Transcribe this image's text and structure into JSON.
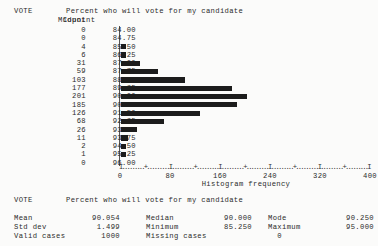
{
  "report": {
    "variable_name": "VOTE",
    "variable_label": "Percent who will vote for my candidate",
    "headers": {
      "count": "Count",
      "midpoint": "Midpoint"
    },
    "axis_title": "Histogram frequency"
  },
  "chart_data": {
    "type": "bar",
    "orientation": "horizontal",
    "title": "Percent who will vote for my candidate",
    "xlabel": "Histogram frequency",
    "ylabel": "Midpoint",
    "xlim": [
      0,
      400
    ],
    "xticks": [
      0,
      80,
      160,
      240,
      320,
      400
    ],
    "minor_tick_step": 40,
    "grid": false,
    "legend": null,
    "bar_color": "#1c1c1c",
    "categories": [
      "84.00",
      "84.75",
      "85.50",
      "86.25",
      "87.00",
      "87.75",
      "88.50",
      "89.25",
      "90.00",
      "90.75",
      "91.50",
      "92.25",
      "93.00",
      "93.75",
      "94.50",
      "95.25",
      "96.00"
    ],
    "values": [
      0,
      0,
      4,
      6,
      31,
      59,
      103,
      177,
      201,
      185,
      126,
      68,
      26,
      11,
      2,
      1,
      0
    ],
    "rows": [
      {
        "count": "0",
        "midpoint": "84.00",
        "value": 0
      },
      {
        "count": "0",
        "midpoint": "84.75",
        "value": 0
      },
      {
        "count": "4",
        "midpoint": "85.50",
        "value": 4
      },
      {
        "count": "6",
        "midpoint": "86.25",
        "value": 6
      },
      {
        "count": "31",
        "midpoint": "87.00",
        "value": 31
      },
      {
        "count": "59",
        "midpoint": "87.75",
        "value": 59
      },
      {
        "count": "103",
        "midpoint": "88.50",
        "value": 103
      },
      {
        "count": "177",
        "midpoint": "89.25",
        "value": 177
      },
      {
        "count": "201",
        "midpoint": "90.00",
        "value": 201
      },
      {
        "count": "185",
        "midpoint": "90.75",
        "value": 185
      },
      {
        "count": "126",
        "midpoint": "91.50",
        "value": 126
      },
      {
        "count": "68",
        "midpoint": "92.25",
        "value": 68
      },
      {
        "count": "26",
        "midpoint": "93.00",
        "value": 26
      },
      {
        "count": "11",
        "midpoint": "93.75",
        "value": 11
      },
      {
        "count": "2",
        "midpoint": "94.50",
        "value": 2
      },
      {
        "count": "1",
        "midpoint": "95.25",
        "value": 1
      },
      {
        "count": "0",
        "midpoint": "96.00",
        "value": 0
      }
    ]
  },
  "statistics": {
    "variable_name": "VOTE",
    "variable_label": "Percent who will vote for my candidate",
    "rows": [
      [
        {
          "label": "Mean",
          "value": "90.054"
        },
        {
          "label": "Median",
          "value": "90.000"
        },
        {
          "label": "Mode",
          "value": "90.250"
        }
      ],
      [
        {
          "label": "Std dev",
          "value": "1.499"
        },
        {
          "label": "Minimum",
          "value": "85.250"
        },
        {
          "label": "Maximum",
          "value": "95.000"
        }
      ],
      [
        {
          "label": "Valid cases",
          "value": "1000"
        },
        {
          "label": "Missing cases",
          "value": "0"
        }
      ]
    ]
  }
}
